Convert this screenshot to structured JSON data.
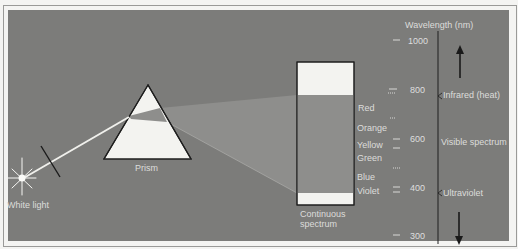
{
  "diagram": {
    "source": {
      "label": "White light"
    },
    "prism": {
      "label": "Prism"
    },
    "spectrum_box": {
      "label_line1": "Continuous",
      "label_line2": "spectrum"
    },
    "colors": [
      "Red",
      "Orange",
      "Yellow",
      "Green",
      "Blue",
      "Violet"
    ],
    "scale": {
      "title": "Wavelength (nm)",
      "ticks": [
        "1000",
        "800",
        "600",
        "400",
        "300"
      ],
      "regions": {
        "infrared": "Infrared (heat)",
        "visible": "Visible spectrum",
        "ultraviolet": "Ultraviolet"
      }
    },
    "palette": {
      "panel": "#7c7c7a",
      "spectrum_fill": "#8e8e8c",
      "white": "#f2f2ef",
      "ink": "#1e1e1e"
    }
  }
}
